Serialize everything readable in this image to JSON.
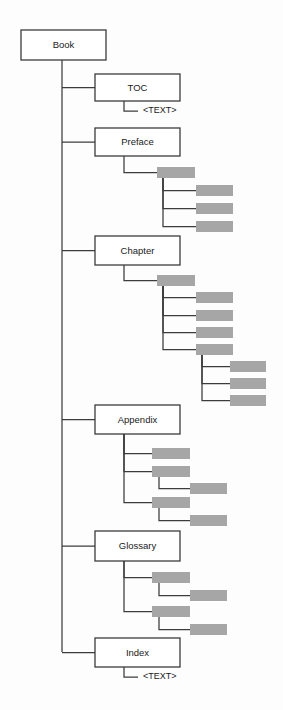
{
  "diagram": {
    "title": "Book",
    "type": "tree",
    "canvas": {
      "width": 283,
      "height": 710
    },
    "colors": {
      "background": "#fdfdfd",
      "box_fill": "#ffffff",
      "box_stroke": "#3c3c3c",
      "gray_fill": "#a6a6a6",
      "connector": "#3c3c3c",
      "text": "#1a1a1a"
    },
    "root": {
      "label": "Book",
      "x": 21,
      "y": 30,
      "w": 85,
      "h": 30,
      "spine_x": 62
    },
    "labeled_nodes": [
      {
        "id": "book",
        "label": "Book",
        "x": 21,
        "y": 30,
        "w": 85,
        "h": 30
      },
      {
        "id": "toc",
        "label": "TOC",
        "x": 95,
        "y": 74,
        "w": 85,
        "h": 27
      },
      {
        "id": "preface",
        "label": "Preface",
        "x": 95,
        "y": 128,
        "w": 85,
        "h": 28
      },
      {
        "id": "chapter",
        "label": "Chapter",
        "x": 95,
        "y": 236,
        "w": 85,
        "h": 29
      },
      {
        "id": "appendix",
        "label": "Appendix",
        "x": 95,
        "y": 405,
        "w": 85,
        "h": 29
      },
      {
        "id": "glossary",
        "label": "Glossary",
        "x": 95,
        "y": 531,
        "w": 85,
        "h": 30
      },
      {
        "id": "index",
        "label": "Index",
        "x": 95,
        "y": 638,
        "w": 85,
        "h": 29
      }
    ],
    "text_leaves": [
      {
        "id": "toc-text",
        "label": "<TEXT>",
        "x": 143,
        "y": 111,
        "parent_x": 124,
        "parent_y": 101
      },
      {
        "id": "index-text",
        "label": "<TEXT>",
        "x": 143,
        "y": 677,
        "parent_x": 124,
        "parent_y": 667
      }
    ],
    "gray_nodes": [
      {
        "id": "preface-sec",
        "x": 157,
        "y": 167,
        "w": 38,
        "h": 11,
        "parent": "preface",
        "branch_x": 124
      },
      {
        "id": "preface-s1",
        "x": 196,
        "y": 185,
        "w": 37,
        "h": 11,
        "parent": "preface-sec",
        "branch_x": 163
      },
      {
        "id": "preface-s2",
        "x": 196,
        "y": 203,
        "w": 37,
        "h": 11,
        "parent": "preface-sec",
        "branch_x": 163
      },
      {
        "id": "preface-s3",
        "x": 196,
        "y": 221,
        "w": 37,
        "h": 11,
        "parent": "preface-sec",
        "branch_x": 163
      },
      {
        "id": "chapter-sec",
        "x": 157,
        "y": 275,
        "w": 38,
        "h": 11,
        "parent": "chapter",
        "branch_x": 124
      },
      {
        "id": "chapter-s1",
        "x": 196,
        "y": 292,
        "w": 37,
        "h": 11,
        "parent": "chapter-sec",
        "branch_x": 163
      },
      {
        "id": "chapter-s2",
        "x": 196,
        "y": 310,
        "w": 37,
        "h": 11,
        "parent": "chapter-sec",
        "branch_x": 163
      },
      {
        "id": "chapter-s3",
        "x": 196,
        "y": 327,
        "w": 37,
        "h": 11,
        "parent": "chapter-sec",
        "branch_x": 163
      },
      {
        "id": "chapter-s4",
        "x": 196,
        "y": 344,
        "w": 37,
        "h": 11,
        "parent": "chapter-sec",
        "branch_x": 163
      },
      {
        "id": "chapter-s4a",
        "x": 230,
        "y": 361,
        "w": 36,
        "h": 11,
        "parent": "chapter-s4",
        "branch_x": 202
      },
      {
        "id": "chapter-s4b",
        "x": 230,
        "y": 378,
        "w": 36,
        "h": 11,
        "parent": "chapter-s4",
        "branch_x": 202
      },
      {
        "id": "chapter-s4c",
        "x": 230,
        "y": 395,
        "w": 36,
        "h": 11,
        "parent": "chapter-s4",
        "branch_x": 202
      },
      {
        "id": "appendix-a1",
        "x": 152,
        "y": 448,
        "w": 38,
        "h": 11,
        "parent": "appendix",
        "branch_x": 124
      },
      {
        "id": "appendix-a2",
        "x": 152,
        "y": 466,
        "w": 38,
        "h": 11,
        "parent": "appendix",
        "branch_x": 124
      },
      {
        "id": "appendix-a2a",
        "x": 190,
        "y": 483,
        "w": 37,
        "h": 11,
        "parent": "appendix-a2",
        "branch_x": 159
      },
      {
        "id": "appendix-a3",
        "x": 152,
        "y": 497,
        "w": 38,
        "h": 11,
        "parent": "appendix",
        "branch_x": 124
      },
      {
        "id": "appendix-a3a",
        "x": 190,
        "y": 515,
        "w": 37,
        "h": 11,
        "parent": "appendix-a3",
        "branch_x": 159
      },
      {
        "id": "glossary-g1",
        "x": 152,
        "y": 572,
        "w": 38,
        "h": 11,
        "parent": "glossary",
        "branch_x": 124
      },
      {
        "id": "glossary-g1a",
        "x": 190,
        "y": 590,
        "w": 37,
        "h": 11,
        "parent": "glossary-g1",
        "branch_x": 159
      },
      {
        "id": "glossary-g2",
        "x": 152,
        "y": 606,
        "w": 38,
        "h": 11,
        "parent": "glossary",
        "branch_x": 124
      },
      {
        "id": "glossary-g2a",
        "x": 190,
        "y": 624,
        "w": 37,
        "h": 11,
        "parent": "glossary-g2",
        "branch_x": 159
      }
    ],
    "connectors": {
      "root_spine": {
        "x": 62,
        "y_top": 60,
        "y_bottom": 652
      },
      "root_branch_ys": [
        87,
        142,
        250,
        419,
        546,
        652
      ]
    }
  },
  "chart_data": {
    "type": "tree",
    "title": "Book",
    "nodes": [
      {
        "label": "Book",
        "kind": "labeled",
        "children": [
          {
            "label": "TOC",
            "kind": "labeled",
            "children": [
              {
                "label": "<TEXT>",
                "kind": "text"
              }
            ]
          },
          {
            "label": "Preface",
            "kind": "labeled",
            "children": [
              {
                "label": "",
                "kind": "gray",
                "children": [
                  {
                    "label": "",
                    "kind": "gray"
                  },
                  {
                    "label": "",
                    "kind": "gray"
                  },
                  {
                    "label": "",
                    "kind": "gray"
                  }
                ]
              }
            ]
          },
          {
            "label": "Chapter",
            "kind": "labeled",
            "children": [
              {
                "label": "",
                "kind": "gray",
                "children": [
                  {
                    "label": "",
                    "kind": "gray"
                  },
                  {
                    "label": "",
                    "kind": "gray"
                  },
                  {
                    "label": "",
                    "kind": "gray"
                  },
                  {
                    "label": "",
                    "kind": "gray",
                    "children": [
                      {
                        "label": "",
                        "kind": "gray"
                      },
                      {
                        "label": "",
                        "kind": "gray"
                      },
                      {
                        "label": "",
                        "kind": "gray"
                      }
                    ]
                  }
                ]
              }
            ]
          },
          {
            "label": "Appendix",
            "kind": "labeled",
            "children": [
              {
                "label": "",
                "kind": "gray"
              },
              {
                "label": "",
                "kind": "gray",
                "children": [
                  {
                    "label": "",
                    "kind": "gray"
                  }
                ]
              },
              {
                "label": "",
                "kind": "gray",
                "children": [
                  {
                    "label": "",
                    "kind": "gray"
                  }
                ]
              }
            ]
          },
          {
            "label": "Glossary",
            "kind": "labeled",
            "children": [
              {
                "label": "",
                "kind": "gray",
                "children": [
                  {
                    "label": "",
                    "kind": "gray"
                  }
                ]
              },
              {
                "label": "",
                "kind": "gray",
                "children": [
                  {
                    "label": "",
                    "kind": "gray"
                  }
                ]
              }
            ]
          },
          {
            "label": "Index",
            "kind": "labeled",
            "children": [
              {
                "label": "<TEXT>",
                "kind": "text"
              }
            ]
          }
        ]
      }
    ],
    "counts": {
      "labeled_boxes": 7,
      "gray_boxes": 20,
      "text_leaves": 2
    }
  }
}
